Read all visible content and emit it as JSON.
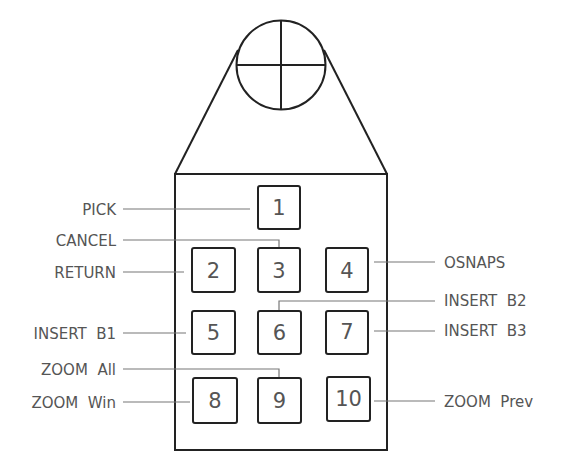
{
  "diagram": {
    "colors": {
      "outline": "#222222",
      "leader": "#777777",
      "text": "#555555"
    },
    "crosshair": {
      "icon": "crosshair-icon"
    },
    "buttons": [
      {
        "number": "1"
      },
      {
        "number": "2"
      },
      {
        "number": "3"
      },
      {
        "number": "4"
      },
      {
        "number": "5"
      },
      {
        "number": "6"
      },
      {
        "number": "7"
      },
      {
        "number": "8"
      },
      {
        "number": "9"
      },
      {
        "number": "10"
      }
    ],
    "labels": {
      "pick": "PICK",
      "cancel": "CANCEL",
      "return": "RETURN",
      "osnaps": "OSNAPS",
      "insert_b2": "INSERT  B2",
      "insert_b1": "INSERT  B1",
      "insert_b3": "INSERT  B3",
      "zoom_all": "ZOOM  All",
      "zoom_win": "ZOOM  Win",
      "zoom_prev": "ZOOM  Prev"
    }
  }
}
